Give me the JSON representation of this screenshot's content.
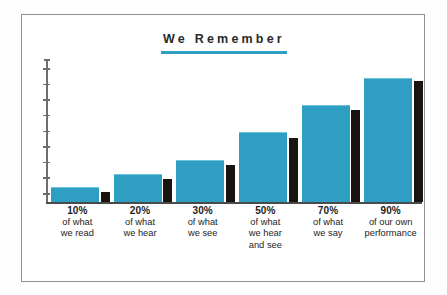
{
  "chart_data": {
    "type": "bar",
    "title": "We Remember",
    "xlabel": "",
    "ylabel": "",
    "grid": false,
    "legend": "none",
    "axis": {
      "y_tick_count": 9,
      "y_tick_labels": [],
      "ylim": [
        0,
        100
      ]
    },
    "categories": [
      "10% of what we read",
      "20% of what we hear",
      "30% of what we see",
      "50% of what we hear and see",
      "70% of what we say",
      "90% of our own performance"
    ],
    "values": [
      10,
      20,
      30,
      50,
      70,
      90
    ],
    "series": [
      {
        "name": "retention",
        "color": "#2e9fc2",
        "values": [
          10,
          20,
          30,
          50,
          70,
          90
        ]
      },
      {
        "name": "shadow",
        "color": "#191410",
        "values": [
          7,
          17,
          27,
          47,
          67,
          88
        ]
      }
    ],
    "bars": [
      {
        "percent": "10%",
        "value": 10,
        "shadow_value": 7,
        "lines": [
          "of what",
          "we read"
        ]
      },
      {
        "percent": "20%",
        "value": 20,
        "shadow_value": 17,
        "lines": [
          "of what",
          "we hear"
        ]
      },
      {
        "percent": "30%",
        "value": 30,
        "shadow_value": 27,
        "lines": [
          "of what",
          "we see"
        ]
      },
      {
        "percent": "50%",
        "value": 50,
        "shadow_value": 47,
        "lines": [
          "of what",
          "we hear",
          "and see"
        ]
      },
      {
        "percent": "70%",
        "value": 70,
        "shadow_value": 67,
        "lines": [
          "of what",
          "we say"
        ]
      },
      {
        "percent": "90%",
        "value": 90,
        "shadow_value": 88,
        "lines": [
          "of our own",
          "performance"
        ]
      }
    ]
  },
  "colors": {
    "bar": "#2e9fc2",
    "bar_top_highlight": "#6ec2da",
    "shadow_bar": "#191410",
    "title_text": "#2a2a2a",
    "title_rule": "#2e9fc2",
    "axis": "#6d6d6d",
    "baseline": "#4a4a4a",
    "frame_border": "#8f8f8f",
    "background": "#ffffff",
    "label_text": "#1d1d1d"
  }
}
